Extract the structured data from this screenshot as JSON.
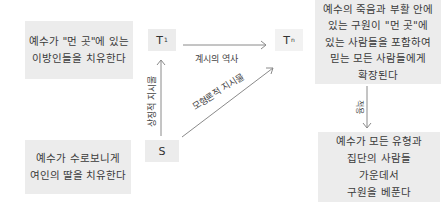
{
  "boxes": {
    "top_left": "예수가 \"먼 곳\"에 있는\n이방인들을 치유한다",
    "bottom_left": "예수가 수로보니게\n여인의 딸을 치유한다",
    "top_right": "예수의 죽음과 부활 안에\n있는 구원이 \"먼 곳\"에\n있는 사람들을 포함하여\n믿는 모든 사람들에게\n확장된다",
    "bottom_right": "예수가 모든 유형과\n집단의 사람들\n가운데서\n구원을 베푼다"
  },
  "nodes": {
    "t1": {
      "base": "T",
      "sup": "1"
    },
    "tn": {
      "base": "T",
      "sup": "n"
    },
    "s": {
      "base": "S"
    }
  },
  "edges": {
    "t1_to_tn": "계시의 역사",
    "s_to_t1": "상징적 지시물",
    "s_to_tn": "모형론적 지시물",
    "tn_to_bottom": "적용"
  },
  "colors": {
    "box_fill": "#ececec",
    "line": "#888888",
    "text": "#3a3a3a"
  }
}
